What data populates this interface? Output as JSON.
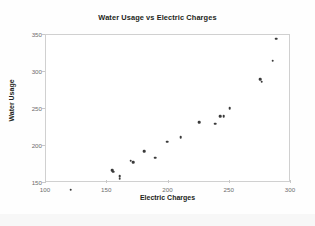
{
  "chart_data": {
    "type": "scatter",
    "title": "Water Usage vs Electric Charges",
    "xlabel": "Electric Charges",
    "ylabel": "Water Usage",
    "xlim": [
      100,
      300
    ],
    "ylim": [
      150,
      350
    ],
    "xticks": [
      100,
      150,
      200,
      250,
      300
    ],
    "yticks": [
      150,
      200,
      250,
      300,
      350
    ],
    "grid": false,
    "legend": null,
    "marker_color": "#3a3a3a",
    "points": [
      {
        "x": 120,
        "y": 141
      },
      {
        "x": 154,
        "y": 167
      },
      {
        "x": 155,
        "y": 165
      },
      {
        "x": 160,
        "y": 159
      },
      {
        "x": 160,
        "y": 156
      },
      {
        "x": 169,
        "y": 180
      },
      {
        "x": 171,
        "y": 178
      },
      {
        "x": 180,
        "y": 193
      },
      {
        "x": 189,
        "y": 184
      },
      {
        "x": 199,
        "y": 206
      },
      {
        "x": 210,
        "y": 212
      },
      {
        "x": 225,
        "y": 232
      },
      {
        "x": 238,
        "y": 230
      },
      {
        "x": 242,
        "y": 240
      },
      {
        "x": 245,
        "y": 240
      },
      {
        "x": 250,
        "y": 251
      },
      {
        "x": 275,
        "y": 290
      },
      {
        "x": 276,
        "y": 287
      },
      {
        "x": 285,
        "y": 315
      },
      {
        "x": 288,
        "y": 345
      }
    ]
  }
}
